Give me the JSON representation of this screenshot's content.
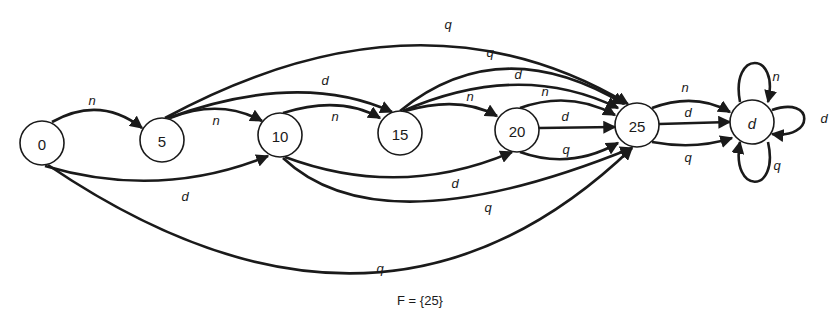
{
  "diagram": {
    "type": "finite-automaton",
    "caption": "F = {25}",
    "nodes": [
      {
        "id": "0",
        "label": "0",
        "x": 42,
        "y": 143
      },
      {
        "id": "5",
        "label": "5",
        "x": 162,
        "y": 140
      },
      {
        "id": "10",
        "label": "10",
        "x": 280,
        "y": 135
      },
      {
        "id": "15",
        "label": "15",
        "x": 400,
        "y": 133
      },
      {
        "id": "20",
        "label": "20",
        "x": 517,
        "y": 130
      },
      {
        "id": "25",
        "label": "25",
        "x": 637,
        "y": 125
      },
      {
        "id": "d",
        "label": "d",
        "x": 752,
        "y": 122
      }
    ],
    "edges": [
      {
        "from": "0",
        "to": "5",
        "label": "n",
        "path": "M 52 122 Q 100 95 142 128",
        "lx": 92,
        "ly": 100
      },
      {
        "from": "0",
        "to": "10",
        "label": "d",
        "path": "M 45 166 Q 160 200 268 156",
        "lx": 185,
        "ly": 196
      },
      {
        "from": "0",
        "to": "25",
        "label": "q",
        "path": "M 48 165 Q 380 390 632 148",
        "lx": 380,
        "ly": 268
      },
      {
        "from": "5",
        "to": "10",
        "label": "n",
        "path": "M 170 118 Q 220 98 262 121",
        "lx": 216,
        "ly": 120
      },
      {
        "from": "5",
        "to": "15",
        "label": "d",
        "path": "M 168 118 Q 300 70 392 112",
        "lx": 325,
        "ly": 80
      },
      {
        "from": "5",
        "to": "25",
        "label": "q",
        "path": "M 165 118 Q 420 -20 628 104",
        "lx": 448,
        "ly": 24
      },
      {
        "from": "10",
        "to": "15",
        "label": "n",
        "path": "M 283 113 Q 340 95 380 118",
        "lx": 335,
        "ly": 116
      },
      {
        "from": "10",
        "to": "20",
        "label": "d",
        "path": "M 285 157 Q 400 200 512 152",
        "lx": 455,
        "ly": 183
      },
      {
        "from": "10",
        "to": "25",
        "label": "q",
        "path": "M 283 158 Q 380 250 632 148",
        "lx": 488,
        "ly": 207
      },
      {
        "from": "15",
        "to": "20",
        "label": "n",
        "path": "M 405 111 Q 460 95 497 116",
        "lx": 470,
        "ly": 96
      },
      {
        "from": "15",
        "to": "25",
        "label": "d",
        "path": "M 403 111 Q 520 60 618 108",
        "lx": 518,
        "ly": 74
      },
      {
        "from": "15",
        "to": "25",
        "label": "q",
        "path": "M 400 111 Q 500 30 624 104",
        "lx": 490,
        "ly": 52
      },
      {
        "from": "20",
        "to": "25",
        "label": "n",
        "path": "M 520 108 Q 570 90 615 115",
        "lx": 545,
        "ly": 91
      },
      {
        "from": "20",
        "to": "25",
        "label": "d",
        "path": "M 539 128 L 615 127",
        "lx": 565,
        "ly": 116
      },
      {
        "from": "20",
        "to": "25",
        "label": "q",
        "path": "M 520 152 Q 570 170 618 143",
        "lx": 566,
        "ly": 149
      },
      {
        "from": "25",
        "to": "d",
        "label": "n",
        "path": "M 652 108 Q 695 92 730 112",
        "lx": 685,
        "ly": 87
      },
      {
        "from": "25",
        "to": "d",
        "label": "d",
        "path": "M 659 124 L 730 122",
        "lx": 688,
        "ly": 112
      },
      {
        "from": "25",
        "to": "d",
        "label": "q",
        "path": "M 652 142 Q 695 150 732 138",
        "lx": 688,
        "ly": 157
      },
      {
        "from": "d",
        "to": "d",
        "label": "n",
        "path": "M 740 102 C 730 50 780 50 768 102",
        "lx": 776,
        "ly": 76
      },
      {
        "from": "d",
        "to": "d",
        "label": "d",
        "path": "M 772 110 C 815 95 815 140 772 134",
        "lx": 824,
        "ly": 118
      },
      {
        "from": "d",
        "to": "d",
        "label": "q",
        "path": "M 768 142 C 780 195 730 195 740 142",
        "lx": 777,
        "ly": 165
      }
    ]
  }
}
